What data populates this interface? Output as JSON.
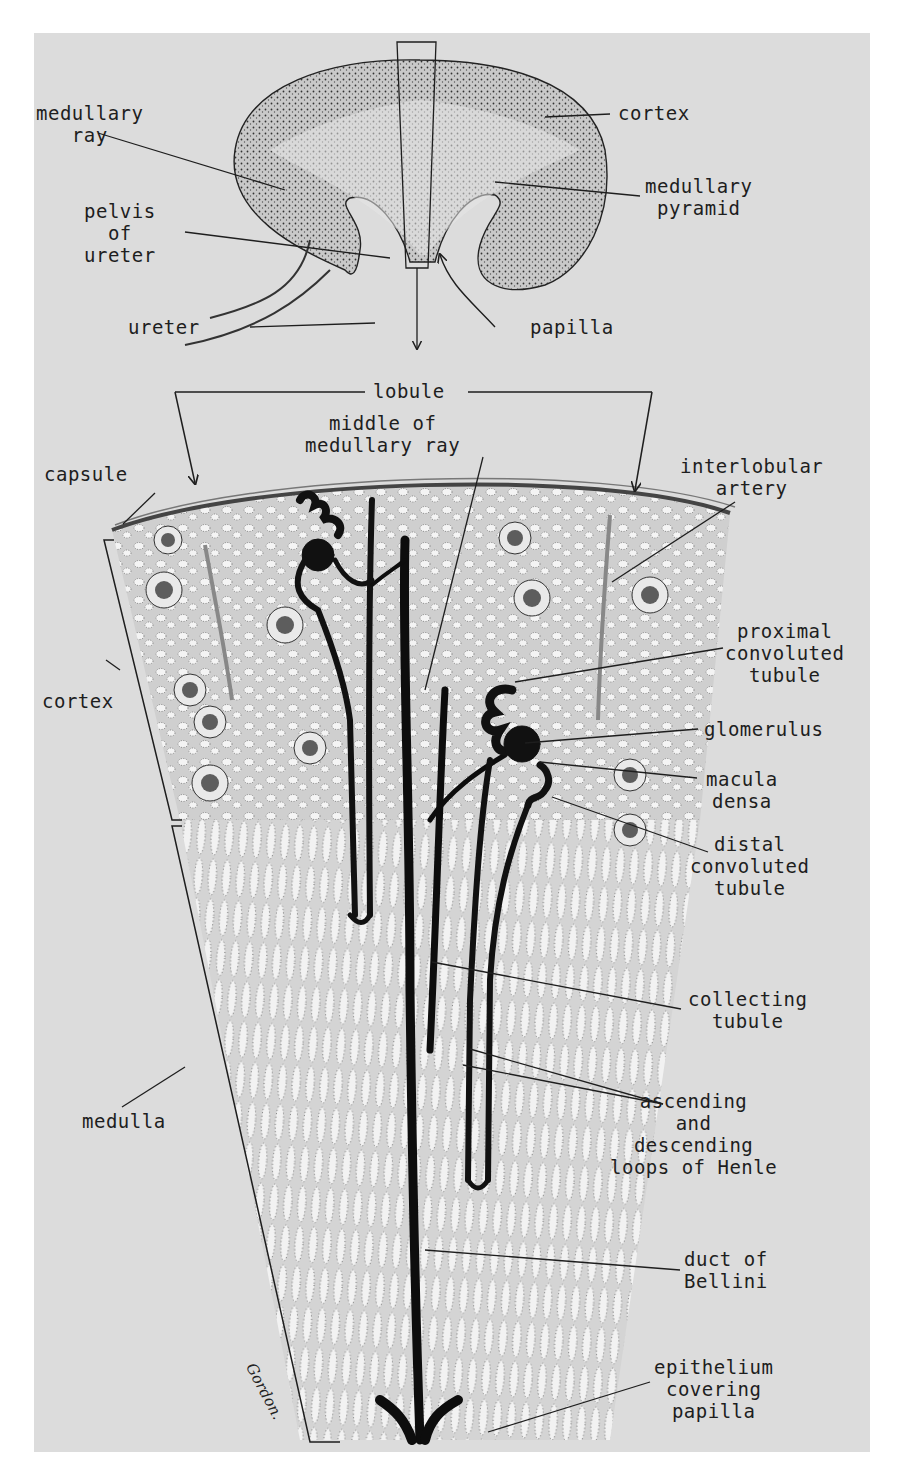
{
  "figure": {
    "signature": "Gordon.",
    "colors": {
      "plate_bg": "#dcdcdc",
      "page_bg": "#ffffff",
      "ink": "#1e1e1e",
      "tissue": "#bdbdbd"
    }
  },
  "labels": {
    "kidney": {
      "medullary_ray": [
        "medullary",
        "ray"
      ],
      "cortex": [
        "cortex"
      ],
      "medullary_pyramid": [
        "medullary",
        "pyramid"
      ],
      "pelvis_of_ureter": [
        "pelvis",
        "of",
        "ureter"
      ],
      "ureter": [
        "ureter"
      ],
      "papilla": [
        "papilla"
      ]
    },
    "lobule": {
      "lobule": [
        "lobule"
      ],
      "middle_of_medullary_ray": [
        "middle of",
        "medullary ray"
      ],
      "capsule": [
        "capsule"
      ],
      "interlobular_artery": [
        "interlobular",
        "artery"
      ],
      "cortex": [
        "cortex"
      ],
      "proximal_convoluted_tubule": [
        "proximal",
        "convoluted",
        "tubule"
      ],
      "glomerulus": [
        "glomerulus"
      ],
      "macula_densa": [
        "macula",
        "densa"
      ],
      "distal_convoluted_tubule": [
        "distal",
        "convoluted",
        "tubule"
      ],
      "collecting_tubule": [
        "collecting",
        "tubule"
      ],
      "medulla": [
        "medulla"
      ],
      "loops_of_henle": [
        "ascending",
        "and",
        "descending",
        "loops of Henle"
      ],
      "duct_of_bellini": [
        "duct of",
        "Bellini"
      ],
      "epithelium_covering_papilla": [
        "epithelium",
        "covering",
        "papilla"
      ]
    }
  }
}
